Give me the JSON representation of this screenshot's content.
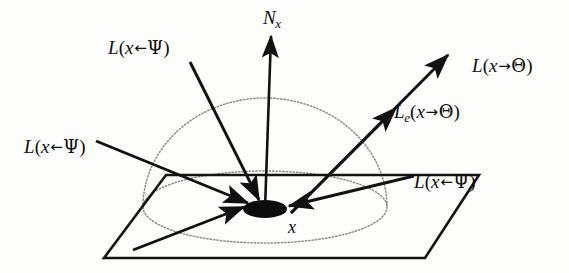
{
  "figure": {
    "name": "light-transport-hemisphere-diagram",
    "background_color": "#fdfdfc",
    "ink_color": "#111111",
    "dotted_color": "#8a8a88",
    "width": 569,
    "height": 273
  },
  "labels": {
    "normal": {
      "symbol": "N",
      "subscript": "x",
      "full": "Nx"
    },
    "incoming_upper_left": {
      "func": "L",
      "arg_open": "(",
      "point": "x",
      "arrow": "←",
      "direction": "Ψ",
      "arg_close": ")",
      "full": "L(x←Ψ)"
    },
    "incoming_left": {
      "func": "L",
      "arg_open": "(",
      "point": "x",
      "arrow": "←",
      "direction": "Ψ",
      "arg_close": ")",
      "full": "L(x←Ψ)"
    },
    "incoming_right": {
      "func": "L",
      "arg_open": "(",
      "point": "x",
      "arrow": "←",
      "direction": "Ψ",
      "arg_close": ")",
      "full": "L(x←Ψ)"
    },
    "outgoing": {
      "func": "L",
      "arg_open": "(",
      "point": "x",
      "arrow": "→",
      "direction": "Θ",
      "arg_close": ")",
      "full": "L(x→Θ)"
    },
    "emitted": {
      "func": "L",
      "subscript": "e",
      "arg_open": "(",
      "point": "x",
      "arrow": "→",
      "direction": "Θ",
      "arg_close": ")",
      "full": "Le(x→Θ)"
    },
    "surface_point": {
      "symbol": "x",
      "full": "x"
    }
  },
  "geometry": {
    "surface_plane": {
      "type": "parallelogram",
      "points": "104,258 166,175 479,175 425,258"
    },
    "hemisphere_dome": {
      "type": "arc",
      "center_x": 265,
      "center_y": 207,
      "radius_x": 122,
      "radius_y": 109,
      "style": "dotted"
    },
    "hemisphere_base": {
      "type": "ellipse",
      "center_x": 265,
      "center_y": 207,
      "radius_x": 122,
      "radius_y": 36,
      "style": "dotted"
    },
    "surface_point_marker": {
      "type": "filled-ellipse",
      "center_x": 265,
      "center_y": 209,
      "radius_x": 22,
      "radius_y": 9
    },
    "rays": [
      {
        "name": "normal",
        "x1": 265,
        "y1": 209,
        "x2": 271,
        "y2": 34,
        "arrow_at": "end"
      },
      {
        "name": "incoming-upper-left",
        "x1": 190,
        "y1": 62,
        "x2": 258,
        "y2": 199,
        "arrow_at": "end"
      },
      {
        "name": "incoming-left-shallow",
        "x1": 96,
        "y1": 141,
        "x2": 247,
        "y2": 203,
        "arrow_at": "end"
      },
      {
        "name": "incoming-left-steep",
        "x1": 135,
        "y1": 249,
        "x2": 243,
        "y2": 206,
        "arrow_at": "end"
      },
      {
        "name": "incoming-right",
        "x1": 412,
        "y1": 176,
        "x2": 288,
        "y2": 205,
        "arrow_at": "end"
      },
      {
        "name": "outgoing-emitted",
        "x1": 290,
        "y1": 212,
        "x2": 445,
        "y2": 57,
        "arrow_at": "end",
        "mid_arrow": true
      }
    ]
  }
}
